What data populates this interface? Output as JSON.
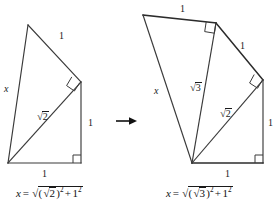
{
  "figure": {
    "stroke_color": "#3a3a3a",
    "text_color": "#1a1a1a",
    "background": "#ffffff"
  },
  "transition": {
    "arrow_icon": "right-arrow-icon",
    "direction": "right"
  },
  "left_panel": {
    "name": "left-figure",
    "labels": {
      "slant_top": "1",
      "vertical_right": "1",
      "base": "1",
      "hypotenuse_sign": "√",
      "hypotenuse_body": "2",
      "side_x": "x"
    },
    "formula": {
      "lhs": "x",
      "equals": "=",
      "outer_radical_sign": "√",
      "inner_open": "(",
      "inner_radical_sign": "√",
      "inner_body": "2",
      "inner_close": ")",
      "inner_exponent": "2",
      "plus": "+",
      "second_term": "1",
      "second_exponent": "2",
      "plain": "x = √((√2)² + 1²)"
    },
    "right_angle_markers": 2
  },
  "right_panel": {
    "name": "right-figure",
    "labels": {
      "top_edge": "1",
      "outer_slant": "1",
      "vertical_right": "1",
      "base": "1",
      "inner_hypotenuse_sign": "√",
      "inner_hypotenuse_body": "3",
      "old_hypotenuse_sign": "√",
      "old_hypotenuse_body": "2",
      "side_x": "x"
    },
    "formula": {
      "lhs": "x",
      "equals": "=",
      "outer_radical_sign": "√",
      "inner_open": "(",
      "inner_radical_sign": "√",
      "inner_body": "3",
      "inner_close": ")",
      "inner_exponent": "2",
      "plus": "+",
      "second_term": "1",
      "second_exponent": "2",
      "plain": "x = √((√3)² + 1²)"
    },
    "right_angle_markers": 3
  }
}
